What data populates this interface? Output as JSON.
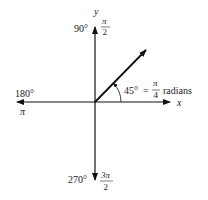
{
  "diagram": {
    "axes": {
      "x_label": "x",
      "y_label": "y"
    },
    "directions": {
      "up": {
        "degrees": "90°",
        "radians_num": "π",
        "radians_den": "2"
      },
      "left": {
        "degrees": "180°",
        "radians": "π"
      },
      "down": {
        "degrees": "270°",
        "radians_num": "3π",
        "radians_den": "2"
      }
    },
    "angle": {
      "degrees": "45°",
      "equals": "=",
      "radians_num": "π",
      "radians_den": "4",
      "unit": "radians"
    },
    "colors": {
      "line": "#111111",
      "text": "#222222",
      "background": "#ffffff"
    }
  }
}
